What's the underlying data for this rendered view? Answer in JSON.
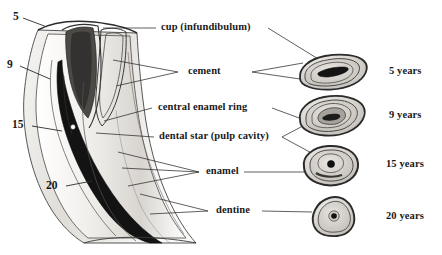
{
  "figure": {
    "background_color": "#ffffff",
    "ink_color": "#1a1a1a",
    "line_color": "#3a3a3a",
    "shade_light": "#e2e0dd",
    "shade_mid": "#b6b3ae",
    "shade_dark": "#6e6b66",
    "shade_black": "#161616"
  },
  "part_labels": [
    {
      "id": "cup",
      "text": "cup (infundibulum)"
    },
    {
      "id": "cement",
      "text": "cement"
    },
    {
      "id": "central-enamel-ring",
      "text": "central enamel ring"
    },
    {
      "id": "dental-star",
      "text": "dental star (pulp cavity)"
    },
    {
      "id": "enamel",
      "text": "enamel"
    },
    {
      "id": "dentine",
      "text": "dentine"
    }
  ],
  "age_marks": [
    {
      "id": "mark-5",
      "text": "5"
    },
    {
      "id": "mark-9",
      "text": "9"
    },
    {
      "id": "mark-15",
      "text": "15"
    },
    {
      "id": "mark-20",
      "text": "20"
    }
  ],
  "age_rows": [
    {
      "id": "age-5",
      "text": "5 years"
    },
    {
      "id": "age-9",
      "text": "9 years"
    },
    {
      "id": "age-15",
      "text": "15 years"
    },
    {
      "id": "age-20",
      "text": "20 years"
    }
  ],
  "caption_fragment": ""
}
